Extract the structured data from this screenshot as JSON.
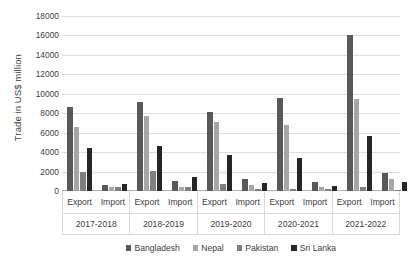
{
  "chart_data": {
    "type": "bar",
    "title": "",
    "subtitle": "",
    "xlabel": "",
    "ylabel": "Trade in US$ million",
    "ylim": [
      0,
      18000
    ],
    "ytick_step": 2000,
    "ytick_labels": [
      "18000",
      "16000",
      "14000",
      "12000",
      "10000",
      "8000",
      "6000",
      "4000",
      "2000",
      "0"
    ],
    "ytick_values": [
      18000,
      16000,
      14000,
      12000,
      10000,
      8000,
      6000,
      4000,
      2000,
      0
    ],
    "grid": true,
    "legend_position": "bottom",
    "categories": [
      "2017-2018",
      "2018-2019",
      "2019-2020",
      "2020-2021",
      "2021-2022"
    ],
    "sub_categories": [
      "Export",
      "Import"
    ],
    "series": [
      {
        "name": "Bangladesh",
        "color": "#595959",
        "values": {
          "Export": [
            8600,
            9150,
            8150,
            9600,
            16000
          ],
          "Import": [
            600,
            1000,
            1200,
            950,
            1900
          ]
        }
      },
      {
        "name": "Nepal",
        "color": "#a6a6a6",
        "values": {
          "Export": [
            6550,
            7700,
            7100,
            6750,
            9500
          ],
          "Import": [
            400,
            400,
            600,
            450,
            1250
          ]
        }
      },
      {
        "name": "Pakistan",
        "color": "#7f7f7f",
        "values": {
          "Export": [
            1950,
            2050,
            750,
            200,
            400
          ],
          "Import": [
            450,
            450,
            200,
            200,
            150
          ]
        }
      },
      {
        "name": "Sri Lanka",
        "color": "#262626",
        "values": {
          "Export": [
            4450,
            4650,
            3750,
            3400,
            5700
          ],
          "Import": [
            700,
            1450,
            800,
            500,
            900
          ]
        }
      }
    ]
  }
}
